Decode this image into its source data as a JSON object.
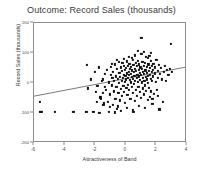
{
  "chart_data": {
    "type": "scatter",
    "title": "Outcome: Record Sales (thousands)",
    "xlabel": "Attractiveness of Band",
    "ylabel": "Record Sales (thousands)",
    "xlim": [
      -6,
      4
    ],
    "ylim": [
      -200,
      200
    ],
    "xticks": [
      -6,
      -4,
      -2,
      0,
      2,
      4
    ],
    "xtick_labels": [
      "-6",
      "-4",
      "-2",
      "0",
      "2",
      "4"
    ],
    "yticks": [
      -200,
      -100,
      0,
      100,
      200
    ],
    "ytick_labels": [
      "-200",
      "-100",
      "0",
      "100",
      "200"
    ],
    "grid": false,
    "legend": false,
    "marker": "square",
    "marker_color": "#111111",
    "frame_color": "#8c8c8c",
    "trendline": {
      "type": "linear",
      "color": "#555555",
      "x_start": -6,
      "y_start": -48,
      "x_end": 4,
      "y_end": 50
    },
    "points": [
      [
        -5.62,
        -62
      ],
      [
        -5.58,
        -95
      ],
      [
        -5.52,
        -96
      ],
      [
        -4.62,
        -95
      ],
      [
        -3.42,
        -95
      ],
      [
        -2.58,
        -95
      ],
      [
        -2.52,
        60
      ],
      [
        -2.46,
        -18
      ],
      [
        -2.12,
        -95
      ],
      [
        -1.98,
        -30
      ],
      [
        -1.86,
        -10
      ],
      [
        -1.72,
        -100
      ],
      [
        -1.66,
        -48
      ],
      [
        -1.62,
        -52
      ],
      [
        -1.58,
        8
      ],
      [
        -1.52,
        -32
      ],
      [
        -1.48,
        12
      ],
      [
        -1.44,
        -68
      ],
      [
        -1.38,
        -12
      ],
      [
        -1.34,
        30
      ],
      [
        -1.28,
        -22
      ],
      [
        -1.22,
        44
      ],
      [
        -1.18,
        -62
      ],
      [
        -1.12,
        -96
      ],
      [
        -1.08,
        2
      ],
      [
        -1.02,
        -38
      ],
      [
        -0.98,
        26
      ],
      [
        -0.96,
        54
      ],
      [
        -0.92,
        -8
      ],
      [
        -0.88,
        18
      ],
      [
        -0.86,
        -72
      ],
      [
        -0.82,
        36
      ],
      [
        -0.78,
        -28
      ],
      [
        -0.76,
        6
      ],
      [
        -0.72,
        62
      ],
      [
        -0.68,
        -52
      ],
      [
        -0.66,
        22
      ],
      [
        -0.62,
        -14
      ],
      [
        -0.58,
        48
      ],
      [
        -0.56,
        -86
      ],
      [
        -0.52,
        14
      ],
      [
        -0.48,
        -34
      ],
      [
        -0.46,
        70
      ],
      [
        -0.44,
        0
      ],
      [
        -0.42,
        34
      ],
      [
        -0.38,
        -58
      ],
      [
        -0.36,
        20
      ],
      [
        -0.34,
        52
      ],
      [
        -0.32,
        -20
      ],
      [
        -0.28,
        8
      ],
      [
        -0.26,
        40
      ],
      [
        -0.24,
        -44
      ],
      [
        -0.22,
        66
      ],
      [
        -0.18,
        16
      ],
      [
        -0.16,
        -10
      ],
      [
        -0.14,
        28
      ],
      [
        -0.12,
        58
      ],
      [
        -0.1,
        -30
      ],
      [
        -0.08,
        4
      ],
      [
        -0.06,
        44
      ],
      [
        -0.04,
        -66
      ],
      [
        -0.02,
        24
      ],
      [
        0.0,
        12
      ],
      [
        0.02,
        50
      ],
      [
        0.04,
        -16
      ],
      [
        0.06,
        32
      ],
      [
        0.08,
        72
      ],
      [
        0.1,
        -40
      ],
      [
        0.12,
        18
      ],
      [
        0.14,
        56
      ],
      [
        0.16,
        -6
      ],
      [
        0.18,
        38
      ],
      [
        0.2,
        26
      ],
      [
        0.22,
        -24
      ],
      [
        0.24,
        64
      ],
      [
        0.26,
        10
      ],
      [
        0.28,
        46
      ],
      [
        0.3,
        -52
      ],
      [
        0.32,
        30
      ],
      [
        0.34,
        2
      ],
      [
        0.36,
        54
      ],
      [
        0.38,
        -14
      ],
      [
        0.4,
        42
      ],
      [
        0.42,
        20
      ],
      [
        0.44,
        78
      ],
      [
        0.46,
        -34
      ],
      [
        0.48,
        14
      ],
      [
        0.5,
        60
      ],
      [
        0.52,
        -4
      ],
      [
        0.54,
        36
      ],
      [
        0.56,
        24
      ],
      [
        0.58,
        -60
      ],
      [
        0.6,
        48
      ],
      [
        0.62,
        8
      ],
      [
        0.64,
        68
      ],
      [
        0.66,
        -22
      ],
      [
        0.68,
        40
      ],
      [
        0.7,
        16
      ],
      [
        0.72,
        56
      ],
      [
        0.74,
        -44
      ],
      [
        0.76,
        28
      ],
      [
        0.78,
        4
      ],
      [
        0.8,
        74
      ],
      [
        0.82,
        -12
      ],
      [
        0.84,
        44
      ],
      [
        0.86,
        22
      ],
      [
        0.88,
        62
      ],
      [
        0.9,
        -30
      ],
      [
        0.92,
        34
      ],
      [
        0.94,
        10
      ],
      [
        0.96,
        52
      ],
      [
        0.98,
        -50
      ],
      [
        1.0,
        26
      ],
      [
        1.02,
        150
      ],
      [
        1.04,
        46
      ],
      [
        1.06,
        2
      ],
      [
        1.08,
        70
      ],
      [
        1.1,
        -18
      ],
      [
        1.12,
        38
      ],
      [
        1.14,
        18
      ],
      [
        1.16,
        58
      ],
      [
        1.18,
        -38
      ],
      [
        1.2,
        30
      ],
      [
        1.22,
        6
      ],
      [
        1.24,
        66
      ],
      [
        1.26,
        -8
      ],
      [
        1.28,
        42
      ],
      [
        1.3,
        20
      ],
      [
        1.32,
        86
      ],
      [
        1.34,
        -26
      ],
      [
        1.36,
        34
      ],
      [
        1.38,
        12
      ],
      [
        1.4,
        54
      ],
      [
        1.42,
        -56
      ],
      [
        1.44,
        24
      ],
      [
        1.46,
        0
      ],
      [
        1.48,
        62
      ],
      [
        1.5,
        -16
      ],
      [
        1.52,
        40
      ],
      [
        1.54,
        90
      ],
      [
        1.56,
        28
      ],
      [
        1.58,
        -46
      ],
      [
        1.6,
        50
      ],
      [
        1.62,
        14
      ],
      [
        1.64,
        74
      ],
      [
        1.66,
        -28
      ],
      [
        1.68,
        36
      ],
      [
        1.7,
        58
      ],
      [
        1.72,
        8
      ],
      [
        1.74,
        -70
      ],
      [
        1.76,
        44
      ],
      [
        1.78,
        22
      ],
      [
        1.8,
        64
      ],
      [
        1.84,
        -36
      ],
      [
        1.88,
        32
      ],
      [
        1.92,
        52
      ],
      [
        1.96,
        4
      ],
      [
        2.0,
        78
      ],
      [
        2.04,
        -24
      ],
      [
        2.08,
        40
      ],
      [
        2.12,
        18
      ],
      [
        2.16,
        60
      ],
      [
        2.2,
        -88
      ],
      [
        2.24,
        30
      ],
      [
        2.3,
        50
      ],
      [
        2.36,
        12
      ],
      [
        2.42,
        -62
      ],
      [
        2.48,
        36
      ],
      [
        2.54,
        56
      ],
      [
        2.62,
        6
      ],
      [
        2.7,
        44
      ],
      [
        2.78,
        26
      ],
      [
        2.96,
        130
      ],
      [
        3.02,
        38
      ],
      [
        -0.54,
        -78
      ],
      [
        -0.3,
        -92
      ],
      [
        0.06,
        -84
      ],
      [
        0.44,
        -90
      ],
      [
        0.86,
        -76
      ],
      [
        1.26,
        -82
      ],
      [
        -1.04,
        -80
      ],
      [
        -1.46,
        -74
      ],
      [
        0.22,
        88
      ],
      [
        0.62,
        92
      ],
      [
        1.02,
        96
      ],
      [
        1.42,
        84
      ],
      [
        -0.14,
        80
      ],
      [
        -0.58,
        76
      ],
      [
        1.62,
        100
      ],
      [
        1.18,
        104
      ],
      [
        0.78,
        108
      ],
      [
        0.38,
        84
      ],
      [
        -0.92,
        64
      ],
      [
        2.86,
        46
      ],
      [
        -2.04,
        36
      ],
      [
        -1.78,
        52
      ],
      [
        -2.26,
        12
      ],
      [
        -1.9,
        -64
      ],
      [
        0.5,
        -96
      ],
      [
        -0.7,
        -98
      ],
      [
        1.74,
        -54
      ],
      [
        2.08,
        -44
      ]
    ]
  }
}
